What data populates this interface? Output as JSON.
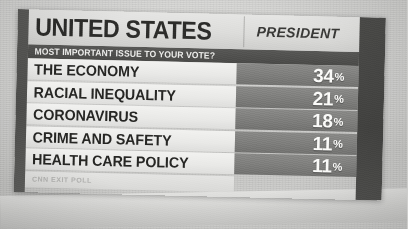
{
  "header": {
    "title": "UNITED STATES",
    "race": "PRESIDENT",
    "question": "MOST IMPORTANT ISSUE TO YOUR VOTE?"
  },
  "source": "CNN EXIT POLL",
  "lower_band_text": "",
  "percent_symbol": "%",
  "colors": {
    "header_bg": "#e0e0de",
    "subtitle_bg": "#4f4f4d",
    "label_bg": "#eeeeec",
    "value_bg": "#7e7e7c",
    "value_text": "#fbfbf9",
    "label_text": "#262624",
    "spine": "#4e4e4c"
  },
  "chart_data": {
    "type": "bar",
    "subtitle": "MOST IMPORTANT ISSUE TO YOUR VOTE?",
    "xlabel": "",
    "ylabel": "Share of voters (%)",
    "ylim": [
      0,
      100
    ],
    "grid": false,
    "legend": "none",
    "source": "CNN EXIT POLL",
    "categories": [
      "THE ECONOMY",
      "RACIAL INEQUALITY",
      "CORONAVIRUS",
      "CRIME AND SAFETY",
      "HEALTH CARE POLICY"
    ],
    "values": [
      34,
      21,
      18,
      11,
      11
    ],
    "value_labels": [
      "34%",
      "21%",
      "18%",
      "11%",
      "11%"
    ],
    "rows": [
      {
        "label": "THE ECONOMY",
        "value": 34,
        "value_text": "34"
      },
      {
        "label": "RACIAL INEQUALITY",
        "value": 21,
        "value_text": "21"
      },
      {
        "label": "CORONAVIRUS",
        "value": 18,
        "value_text": "18"
      },
      {
        "label": "CRIME AND SAFETY",
        "value": 11,
        "value_text": "11"
      },
      {
        "label": "HEALTH CARE POLICY",
        "value": 11,
        "value_text": "11"
      }
    ]
  }
}
